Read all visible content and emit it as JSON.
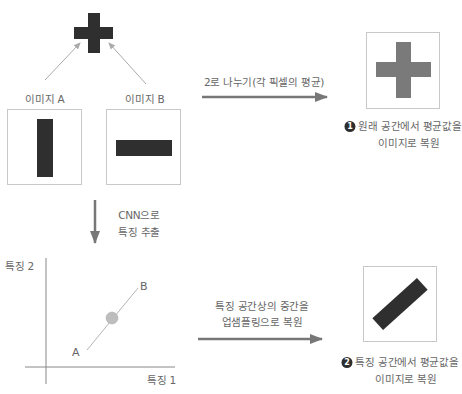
{
  "diagram": {
    "top": {
      "merged_shape": "cross",
      "label_a": "이미지 A",
      "label_b": "이미지 B"
    },
    "image_a": {
      "shape": "vertical-bar"
    },
    "image_b": {
      "shape": "horizontal-bar"
    },
    "pixel_average": {
      "arrow_label": "2로 나누기(각 픽셀의 평균)",
      "result_shape": "cross",
      "caption_number": "1",
      "caption_line1": "원래 공간에서 평균값을",
      "caption_line2": "이미지로 복원"
    },
    "cnn_step": {
      "line1": "CNN으로",
      "line2": "특징 추출"
    },
    "feature_plot": {
      "y_axis_label": "특징 2",
      "x_axis_label": "특징 1",
      "point_a": "A",
      "point_b": "B",
      "midpoint": "midpoint-circle"
    },
    "feature_average": {
      "arrow_label_line1": "특징 공간상의 중간을",
      "arrow_label_line2": "업샘플링으로 복원",
      "result_shape": "diagonal-bar",
      "caption_number": "2",
      "caption_line1": "특징 공간에서 평균값을",
      "caption_line2": "이미지로 복원"
    },
    "colors": {
      "dark_shape": "#2f2f2f",
      "light_shape": "#7a7a7a",
      "arrow": "#777777",
      "thin_line": "#aaaaaa",
      "box_border": "#c8c8c8",
      "midpoint": "#bdbdbd"
    }
  }
}
